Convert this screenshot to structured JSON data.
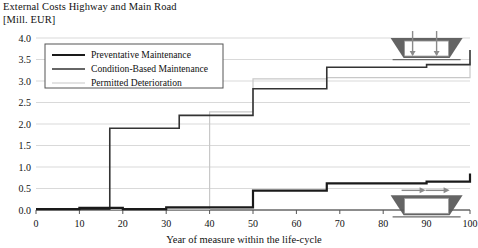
{
  "chart_data": {
    "type": "line",
    "title": "External Costs Highway and Main Road\n[Mill. EUR]",
    "title_line1": "External Costs Highway and Main Road",
    "title_line2": "[Mill. EUR]",
    "xlabel": "Year of measure within the life-cycle",
    "ylabel": "[Mill. EUR]",
    "xlim": [
      0,
      100
    ],
    "ylim": [
      0.0,
      4.0
    ],
    "xticks": [
      0,
      10,
      20,
      30,
      40,
      50,
      60,
      70,
      80,
      90,
      100
    ],
    "xtick_labels": [
      "0",
      "10",
      "20",
      "30",
      "40",
      "50",
      "60",
      "70",
      "80",
      "90",
      "100"
    ],
    "yticks": [
      0.0,
      0.5,
      1.0,
      1.5,
      2.0,
      2.5,
      3.0,
      3.5,
      4.0
    ],
    "ytick_labels": [
      "0.0",
      "0.5",
      "1.0",
      "1.5",
      "2.0",
      "2.5",
      "3.0",
      "3.5",
      "4.0"
    ],
    "grid": true,
    "grid_axis": "y",
    "legend_position": "upper-left",
    "drawstyle": "steps-post",
    "series": [
      {
        "name": "Preventative Maintenance",
        "color": "#1a1a1a",
        "width": 2.2,
        "points": [
          {
            "x": 0,
            "y": 0.02
          },
          {
            "x": 8,
            "y": 0.02
          },
          {
            "x": 10,
            "y": 0.05
          },
          {
            "x": 17,
            "y": 0.05
          },
          {
            "x": 20,
            "y": 0.02
          },
          {
            "x": 27,
            "y": 0.02
          },
          {
            "x": 30,
            "y": 0.06
          },
          {
            "x": 33,
            "y": 0.06
          },
          {
            "x": 50,
            "y": 0.45
          },
          {
            "x": 62,
            "y": 0.45
          },
          {
            "x": 67,
            "y": 0.62
          },
          {
            "x": 83,
            "y": 0.62
          },
          {
            "x": 90,
            "y": 0.66
          },
          {
            "x": 100,
            "y": 0.85
          }
        ]
      },
      {
        "name": "Condition-Based Maintenance",
        "color": "#333333",
        "width": 1.6,
        "points": [
          {
            "x": 0,
            "y": 0.02
          },
          {
            "x": 17,
            "y": 1.9
          },
          {
            "x": 33,
            "y": 1.9
          },
          {
            "x": 33,
            "y": 2.2
          },
          {
            "x": 50,
            "y": 2.2
          },
          {
            "x": 50,
            "y": 2.82
          },
          {
            "x": 67,
            "y": 2.82
          },
          {
            "x": 67,
            "y": 3.32
          },
          {
            "x": 83,
            "y": 3.32
          },
          {
            "x": 90,
            "y": 3.38
          },
          {
            "x": 100,
            "y": 3.38
          },
          {
            "x": 100,
            "y": 3.72
          }
        ]
      },
      {
        "name": "Permitted Deterioration",
        "color": "#c8c8c8",
        "width": 1.2,
        "points": [
          {
            "x": 0,
            "y": 0.02
          },
          {
            "x": 40,
            "y": 0.02
          },
          {
            "x": 40,
            "y": 2.28
          },
          {
            "x": 50,
            "y": 2.28
          },
          {
            "x": 50,
            "y": 3.05
          },
          {
            "x": 67,
            "y": 3.05
          },
          {
            "x": 67,
            "y": 3.08
          },
          {
            "x": 100,
            "y": 3.08
          },
          {
            "x": 100,
            "y": 3.45
          }
        ]
      }
    ],
    "annotations": [
      {
        "name": "bridge-vertical-load-marker",
        "x": 90,
        "y": 3.72,
        "kind": "trapezoid-down-arrows"
      },
      {
        "name": "bridge-horizontal-load-marker",
        "x": 90,
        "y": 0.62,
        "kind": "trapezoid-right-arrows"
      }
    ]
  },
  "legend": {
    "items": [
      {
        "label": "Preventative Maintenance"
      },
      {
        "label": "Condition-Based Maintenance"
      },
      {
        "label": "Permitted Deterioration"
      }
    ]
  }
}
